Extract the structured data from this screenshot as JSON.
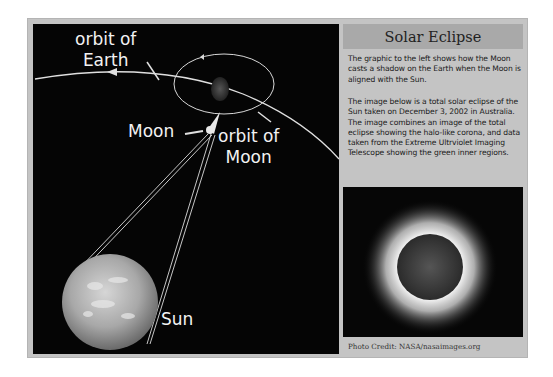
{
  "diagram": {
    "labels": {
      "orbit_earth_line1": "orbit of",
      "orbit_earth_line2": "Earth",
      "moon": "Moon",
      "orbit_moon_line1": "orbit of",
      "orbit_moon_line2": "Moon",
      "sun": "Sun"
    },
    "colors": {
      "background": "#050505",
      "lines": "#e8e8e8",
      "text": "#f2f2f2"
    }
  },
  "info": {
    "title": "Solar Eclipse",
    "paragraph1": "The graphic to the left shows how the Moon casts a shadow on the Earth when the Moon is aligned with the Sun.",
    "paragraph2": "The image below is a total solar eclipse of the Sun taken on December 3, 2002 in Australia. The image combines an image of the total eclipse showing the halo-like corona, and data taken from the Extreme Ultrviolet Imaging Telescope showing the green inner regions.",
    "photo_credit": "Photo Credit: NASA/nasaimages.org"
  }
}
